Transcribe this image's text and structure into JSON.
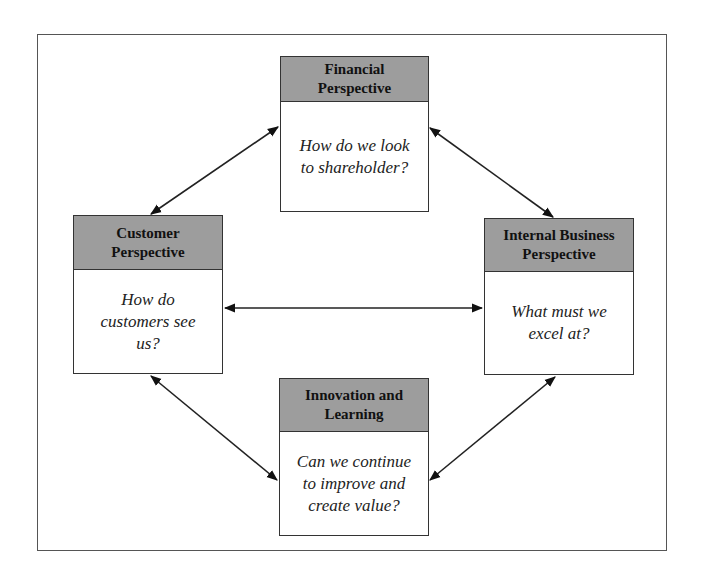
{
  "diagram": {
    "type": "balanced-scorecard",
    "boxes": [
      {
        "id": "financial",
        "header": [
          "Financial",
          "Perspective"
        ],
        "question": [
          "How do we look",
          "to shareholder?"
        ]
      },
      {
        "id": "customer",
        "header": [
          "Customer",
          "Perspective"
        ],
        "question": [
          "How do",
          "customers see",
          "us?"
        ]
      },
      {
        "id": "internal",
        "header": [
          "Internal Business",
          "Perspective"
        ],
        "question": [
          "What must we",
          "excel at?"
        ]
      },
      {
        "id": "innovation",
        "header": [
          "Innovation and",
          "Learning"
        ],
        "question": [
          "Can we continue",
          "to improve and",
          "create value?"
        ]
      }
    ],
    "connections": [
      {
        "from": "customer",
        "to": "financial",
        "bidirectional": true
      },
      {
        "from": "financial",
        "to": "internal",
        "bidirectional": true
      },
      {
        "from": "customer",
        "to": "internal",
        "bidirectional": true
      },
      {
        "from": "customer",
        "to": "innovation",
        "bidirectional": true
      },
      {
        "from": "innovation",
        "to": "internal",
        "bidirectional": true
      }
    ]
  }
}
